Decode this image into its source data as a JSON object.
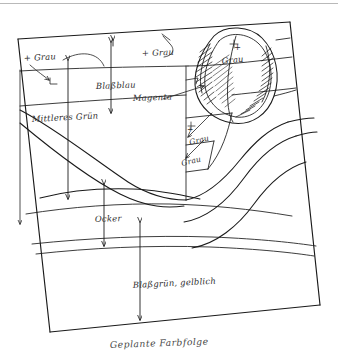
{
  "document": {
    "title": "Geplante Farbfolge",
    "medium": "hand-drawn pencil and ink sketch",
    "background_color": "#ffffff",
    "ink_color": "#1a1a1a",
    "caption": "Geplante Farbfolge"
  },
  "top_rule": {
    "color": "#b9b9b9"
  },
  "labels": [
    {
      "id": "grau-top-left",
      "text": "+ Grau",
      "x": 24,
      "y": 61
    },
    {
      "id": "grau-top-center",
      "text": "+ Grau",
      "x": 142,
      "y": 56
    },
    {
      "id": "grau-leaf-plus",
      "text": "+",
      "x": 234,
      "y": 50
    },
    {
      "id": "grau-leaf",
      "text": "Grau",
      "x": 222,
      "y": 62
    },
    {
      "id": "blassblau",
      "text": "Blaßblau",
      "x": 96,
      "y": 89
    },
    {
      "id": "magenta",
      "text": "Magenta",
      "x": 133,
      "y": 100
    },
    {
      "id": "mittleres-gruen",
      "text": "Mittleres Grün",
      "x": 32,
      "y": 121
    },
    {
      "id": "grau-mid-plus",
      "text": "+",
      "x": 187,
      "y": 132
    },
    {
      "id": "grau-mid-upper",
      "text": "Grau",
      "x": 190,
      "y": 143
    },
    {
      "id": "grau-mid-lower",
      "text": "Grau",
      "x": 182,
      "y": 164
    },
    {
      "id": "ocker",
      "text": "Ocker",
      "x": 95,
      "y": 222
    },
    {
      "id": "blassgruen",
      "text": "Blaßgrün, gelblich",
      "x": 133,
      "y": 287
    }
  ],
  "color_sequence": [
    {
      "name": "Grau",
      "zone": "oberer Rand / Himmel links"
    },
    {
      "name": "Grau",
      "zone": "oberer Rand / Mitte"
    },
    {
      "name": "Grau",
      "zone": "Blattform rechts oben"
    },
    {
      "name": "Blaßblau",
      "zone": "oberes Band"
    },
    {
      "name": "Magenta",
      "zone": "Band unterhalb Blaßblau"
    },
    {
      "name": "Mittleres Grün",
      "zone": "linke Flanke"
    },
    {
      "name": "Grau",
      "zone": "Stützen-Feld Mitte rechts"
    },
    {
      "name": "Grau",
      "zone": "Stützen-Feld unten"
    },
    {
      "name": "Ocker",
      "zone": "mittleres Band"
    },
    {
      "name": "Blaßgrün, gelblich",
      "zone": "unteres Band"
    }
  ],
  "frame": {
    "corners": [
      {
        "x": 18,
        "y": 39
      },
      {
        "x": 290,
        "y": 22
      },
      {
        "x": 320,
        "y": 305
      },
      {
        "x": 50,
        "y": 332
      }
    ]
  }
}
